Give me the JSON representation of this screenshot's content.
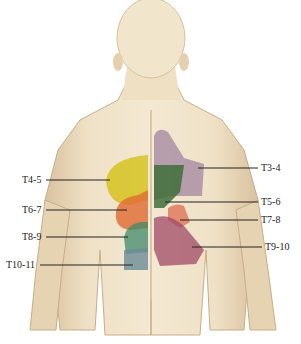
{
  "figure": {
    "colors": {
      "background": "#ffffff",
      "skin": "#ecdcc0",
      "skin_shadow": "#d9c19e",
      "T3-4": "#9c7f9c",
      "T4-5": "#d6c320",
      "T5-6": "#3f6e3a",
      "T6-7": "#e06a32",
      "T7-8": "#e07a5e",
      "T8-9": "#3f8a6a",
      "T9-10": "#a04a66",
      "T10-11": "#6a8c98",
      "leader_line": "#222222"
    },
    "labels_left": [
      {
        "text": "T4-5",
        "x": 22,
        "y": 176
      },
      {
        "text": "T6-7",
        "x": 22,
        "y": 206
      },
      {
        "text": "T8-9",
        "x": 22,
        "y": 233
      },
      {
        "text": "T10-11",
        "x": 6,
        "y": 261
      }
    ],
    "labels_right": [
      {
        "text": "T3-4",
        "x": 262,
        "y": 164
      },
      {
        "text": "T5-6",
        "x": 262,
        "y": 198
      },
      {
        "text": "T7-8",
        "x": 262,
        "y": 216
      },
      {
        "text": "T9-10",
        "x": 266,
        "y": 242
      }
    ]
  }
}
